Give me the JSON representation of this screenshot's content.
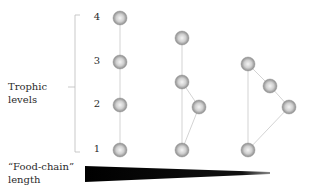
{
  "axis": {
    "title_line1": "Trophic",
    "title_line2": "levels",
    "levels": [
      "4",
      "3",
      "2",
      "1"
    ]
  },
  "bottom": {
    "label_line1": "“Food-chain”",
    "label_line2": "length"
  },
  "colors": {
    "node_fill_center": "#f2f2f2",
    "node_fill_edge": "#8f8f8f",
    "edge": "#c8c8c8",
    "bracket": "#bbbbbb",
    "wedge": "#000000"
  },
  "webs": [
    {
      "name": "linear-chain",
      "nodes": [
        {
          "id": "a1",
          "level": 4,
          "x": 120,
          "y": 18
        },
        {
          "id": "a2",
          "level": 3,
          "x": 120,
          "y": 62
        },
        {
          "id": "a3",
          "level": 2,
          "x": 120,
          "y": 105
        },
        {
          "id": "a4",
          "level": 1,
          "x": 120,
          "y": 150
        }
      ],
      "edges": [
        [
          "a1",
          "a2"
        ],
        [
          "a2",
          "a3"
        ],
        [
          "a3",
          "a4"
        ]
      ]
    },
    {
      "name": "omnivory-web",
      "nodes": [
        {
          "id": "b1",
          "level": 3.5,
          "x": 182,
          "y": 38
        },
        {
          "id": "b2",
          "level": 3,
          "x": 182,
          "y": 82
        },
        {
          "id": "b3",
          "level": 2,
          "x": 199,
          "y": 107
        },
        {
          "id": "b4",
          "level": 1,
          "x": 182,
          "y": 150
        }
      ],
      "edges": [
        [
          "b1",
          "b2"
        ],
        [
          "b2",
          "b3"
        ],
        [
          "b2",
          "b4"
        ],
        [
          "b3",
          "b4"
        ]
      ]
    },
    {
      "name": "short-web",
      "nodes": [
        {
          "id": "c1",
          "level": 3,
          "x": 248,
          "y": 64
        },
        {
          "id": "c2",
          "level": 2.5,
          "x": 270,
          "y": 86
        },
        {
          "id": "c3",
          "level": 2,
          "x": 289,
          "y": 107
        },
        {
          "id": "c4",
          "level": 1,
          "x": 248,
          "y": 150
        }
      ],
      "edges": [
        [
          "c1",
          "c2"
        ],
        [
          "c2",
          "c3"
        ],
        [
          "c1",
          "c4"
        ],
        [
          "c3",
          "c4"
        ]
      ]
    }
  ]
}
